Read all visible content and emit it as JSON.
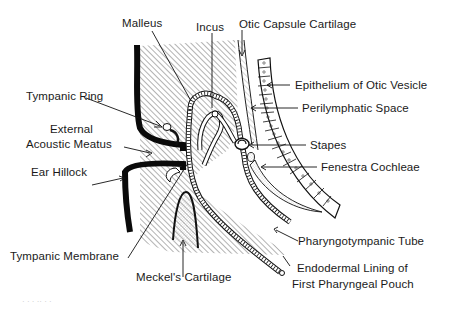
{
  "figure": {
    "type": "anatomical-diagram",
    "colors": {
      "ink": "#111111",
      "hatch": "#555555",
      "stipple": "#9a9a9a",
      "background": "#ffffff"
    }
  },
  "labels": {
    "malleus": "Malleus",
    "incus": "Incus",
    "otic_capsule_cartilage": "Otic Capsule Cartilage",
    "epithelium_of_otic_vesicle": "Epithelium of Otic Vesicle",
    "perilymphatic_space": "Perilymphatic Space",
    "tympanic_ring": "Tympanic Ring",
    "external_acoustic_meatus_line1": "External",
    "external_acoustic_meatus_line2": "Acoustic Meatus",
    "ear_hillock": "Ear Hillock",
    "stapes": "Stapes",
    "fenestra_cochleae": "Fenestra Cochleae",
    "tympanic_membrane": "Tympanic Membrane",
    "meckels_cartilage": "Meckel's Cartilage",
    "pharyngotympanic_tube": "Pharyngotympanic Tube",
    "endodermal_lining_line1": "Endodermal Lining of",
    "endodermal_lining_line2": "First Pharyngeal Pouch"
  },
  "caption": {
    "text": "· · ·  ·· · ·"
  }
}
